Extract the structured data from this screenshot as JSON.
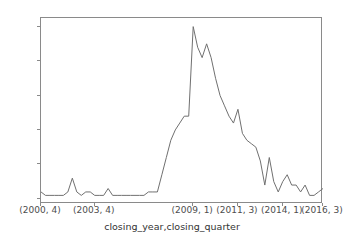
{
  "chart_data": {
    "type": "line",
    "title": "",
    "xlabel": "closing_year,closing_quarter",
    "ylabel": "",
    "ylim": [
      -1.5,
      52.5
    ],
    "yticks": [
      0,
      10,
      20,
      30,
      40,
      50
    ],
    "ytick_labels": [
      "0",
      "10",
      "20",
      "30",
      "40",
      "50"
    ],
    "grid": false,
    "legend": null,
    "line_color": "#707070",
    "axes_color": "#8a8a8a",
    "background_color": "#ffffff",
    "xtick_positions": [
      0,
      12,
      34,
      44,
      54,
      63
    ],
    "xtick_labels": [
      "(2000, 4)",
      "(2003, 4)",
      "(2009, 1)",
      "(2011, 3)",
      "(2014, 1)",
      "(2016, 3)"
    ],
    "x": [
      "(2000, 4)",
      "(2001, 1)",
      "(2001, 2)",
      "(2001, 3)",
      "(2001, 4)",
      "(2002, 1)",
      "(2002, 2)",
      "(2002, 3)",
      "(2002, 4)",
      "(2003, 1)",
      "(2003, 2)",
      "(2003, 3)",
      "(2003, 4)",
      "(2004, 1)",
      "(2004, 2)",
      "(2004, 3)",
      "(2004, 4)",
      "(2005, 1)",
      "(2005, 2)",
      "(2005, 3)",
      "(2005, 4)",
      "(2006, 1)",
      "(2006, 2)",
      "(2006, 3)",
      "(2006, 4)",
      "(2007, 1)",
      "(2007, 2)",
      "(2007, 3)",
      "(2007, 4)",
      "(2008, 1)",
      "(2008, 2)",
      "(2008, 3)",
      "(2008, 4)",
      "(2009, 1)",
      "(2009, 2)",
      "(2009, 3)",
      "(2009, 4)",
      "(2010, 1)",
      "(2010, 2)",
      "(2010, 3)",
      "(2010, 4)",
      "(2011, 1)",
      "(2011, 2)",
      "(2011, 3)",
      "(2011, 4)",
      "(2012, 1)",
      "(2012, 2)",
      "(2012, 3)",
      "(2012, 4)",
      "(2013, 1)",
      "(2013, 2)",
      "(2013, 3)",
      "(2013, 4)",
      "(2014, 1)",
      "(2014, 2)",
      "(2014, 3)",
      "(2014, 4)",
      "(2015, 1)",
      "(2015, 2)",
      "(2015, 3)",
      "(2015, 4)",
      "(2016, 1)",
      "(2016, 2)",
      "(2016, 3)"
    ],
    "values": [
      2,
      1,
      1,
      1,
      1,
      1,
      2,
      6,
      2,
      1,
      2,
      2,
      1,
      1,
      1,
      3,
      1,
      1,
      1,
      1,
      1,
      1,
      1,
      1,
      2,
      2,
      2,
      7,
      12,
      17,
      20,
      22,
      24,
      24,
      50,
      44,
      41,
      45,
      41,
      35,
      30,
      27,
      24,
      22,
      26,
      19,
      17,
      16,
      15,
      11,
      4,
      12,
      5,
      2,
      5,
      7,
      4,
      4,
      2,
      4,
      1,
      1,
      2,
      3
    ]
  }
}
